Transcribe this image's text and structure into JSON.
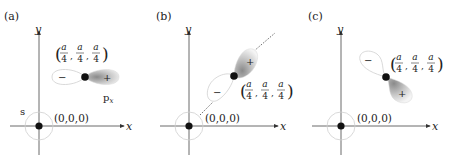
{
  "panels": [
    {
      "label": "(a)",
      "axis_x": "x",
      "axis_y": "y",
      "origin_label": "(0,0,0)",
      "atom_label": "(a/4, a/4, a/4)",
      "frac_num": "a",
      "frac_den": "4",
      "orbital_at_origin": "s",
      "orbital_at_atom": "px",
      "orbital_label_main": "p",
      "orbital_label_sub": "x",
      "lobe_plus": "+",
      "lobe_minus": "−",
      "orientation": "horizontal"
    },
    {
      "label": "(b)",
      "axis_x": "x",
      "axis_y": "y",
      "origin_label": "(0,0,0)",
      "frac_num": "a",
      "frac_den": "4",
      "lobe_plus": "+",
      "lobe_minus": "−",
      "orientation": "diagonal along [111] with dashed guide line"
    },
    {
      "label": "(c)",
      "axis_x": "x",
      "axis_y": "y",
      "origin_label": "(0,0,0)",
      "frac_num": "a",
      "frac_den": "4",
      "lobe_plus": "+",
      "lobe_minus": "−",
      "orientation": "anti-diagonal"
    }
  ],
  "colors": {
    "axis": "#333333",
    "atom": "#111111",
    "lobe_outline": "#bbbbbb",
    "lobe_shade": "#999999",
    "text": "#222222"
  }
}
